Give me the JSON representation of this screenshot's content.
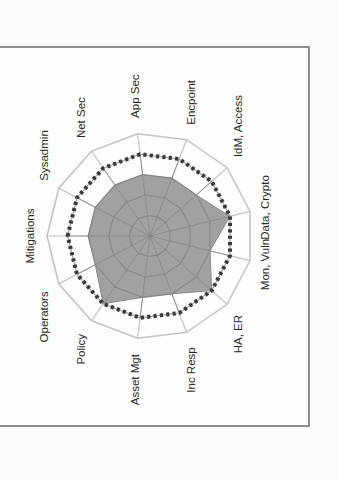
{
  "chart_data": {
    "type": "radar",
    "title": "",
    "orientation": "rotated 90 degrees counter-clockwise (labels read bottom-to-top)",
    "categories": [
      "Mitigations",
      "Sysadmin",
      "Net Sec",
      "App Sec",
      "Encpoint",
      "IdM, Access",
      "Data,  Crypto",
      "Mon, Vuln",
      "HA, ER",
      "Inc Resp",
      "Asset Mgt",
      "Policy",
      "Operators"
    ],
    "series": [
      {
        "name": "Current",
        "style": "filled",
        "color": "#9c9c9c",
        "values": [
          3,
          3,
          3,
          3,
          3,
          3,
          4,
          3,
          4,
          3,
          3,
          4,
          3
        ]
      },
      {
        "name": "Target",
        "style": "dotted",
        "color": "#3a3a3a",
        "values": [
          4,
          4,
          4,
          4,
          4,
          4,
          4,
          4,
          4,
          4,
          4,
          4,
          4
        ]
      }
    ],
    "rlim": [
      0,
      5
    ],
    "grid_rings": 5,
    "grid": true,
    "legend": "none",
    "colors": {
      "grid": "#b8b8b8",
      "outer_ring": "#c4c4c4",
      "fill": "#9c9c9c",
      "dots": "#3a3a3a"
    }
  }
}
